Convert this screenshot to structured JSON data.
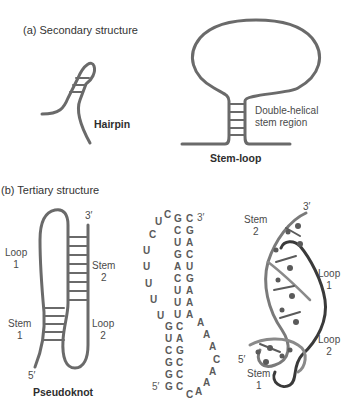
{
  "panel_a": {
    "heading": "(a) Secondary structure",
    "hairpin": {
      "label": "Hairpin"
    },
    "stem_loop": {
      "label": "Stem-loop",
      "annotation_line1": "Double-helical",
      "annotation_line2": "stem region"
    }
  },
  "panel_b": {
    "heading": "(b) Tertiary structure",
    "pseudoknot": {
      "label": "Pseudoknot",
      "three_prime": "3′",
      "five_prime": "5′",
      "loop1": [
        "Loop",
        "1"
      ],
      "stem2": [
        "Stem",
        "2"
      ],
      "stem1": [
        "Stem",
        "1"
      ],
      "loop2": [
        "Loop",
        "2"
      ]
    },
    "sequence": {
      "three_prime": "3′",
      "five_prime": "5′",
      "loop1_nts": [
        "C",
        "U",
        "C",
        "U",
        "U",
        "U",
        "U",
        "U"
      ],
      "stem2_left": [
        "G",
        "C",
        "U",
        "G",
        "A",
        "C",
        "U",
        "U",
        "U"
      ],
      "stem2_right": [
        "C",
        "G",
        "A",
        "C",
        "U",
        "G",
        "A",
        "A",
        "A"
      ],
      "stem1_left": [
        "G",
        "U",
        "C",
        "G",
        "G",
        "G"
      ],
      "stem1_right": [
        "C",
        "A",
        "G",
        "C",
        "C",
        "C"
      ],
      "loop2_nts": [
        "A",
        "A",
        "A",
        "C",
        "A",
        "A",
        "A",
        "C"
      ]
    },
    "structure_3d": {
      "three_prime": "3′",
      "five_prime": "5′",
      "stem2": [
        "Stem",
        "2"
      ],
      "loop1": [
        "Loop",
        "1"
      ],
      "loop2": [
        "Loop",
        "2"
      ],
      "stem1": [
        "Stem",
        "1"
      ]
    }
  },
  "colors": {
    "strand": "#6e6e6e",
    "strand_dark": "#3c3c3c",
    "text": "#3a3a3a"
  }
}
